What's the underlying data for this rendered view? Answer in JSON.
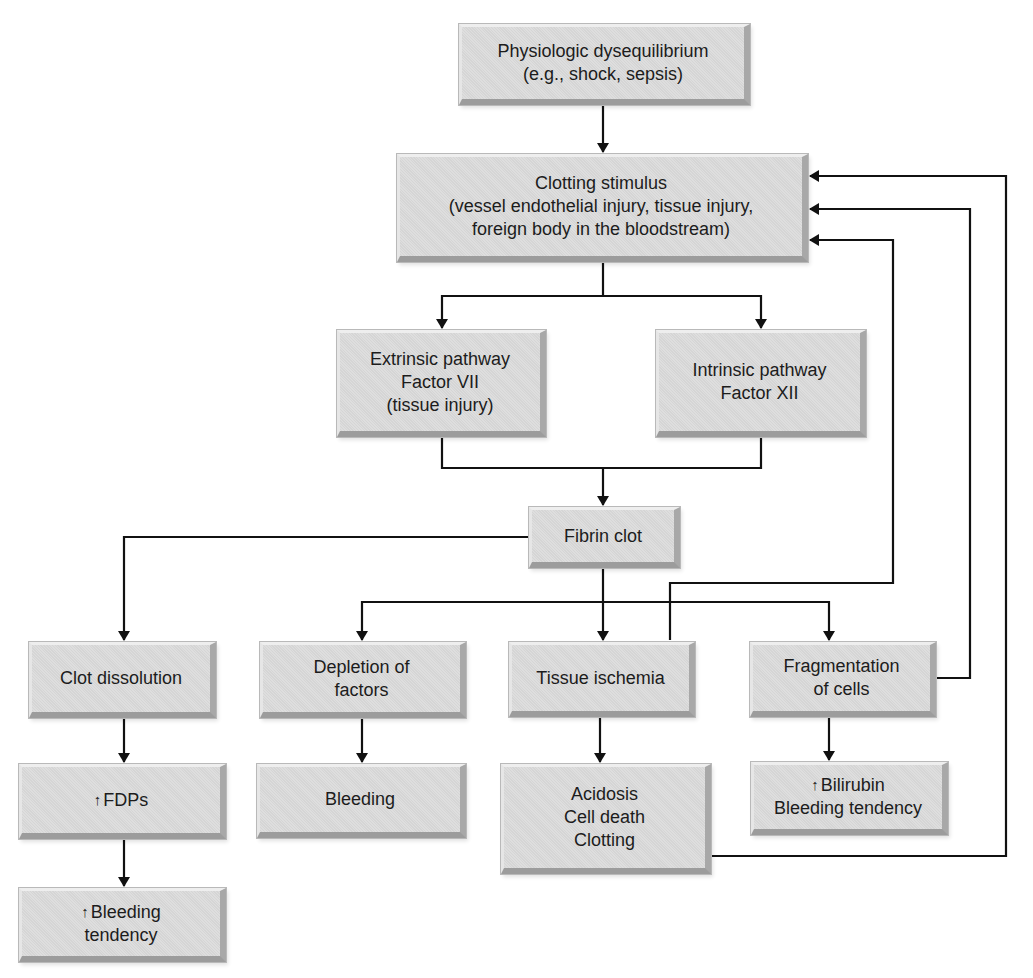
{
  "diagram": {
    "type": "flowchart",
    "nodes": {
      "physiologic": {
        "lines": [
          "Physiologic dysequilibrium",
          "(e.g., shock, sepsis)"
        ]
      },
      "clotting_stimulus": {
        "lines": [
          "Clotting stimulus",
          "(vessel endothelial injury, tissue injury,",
          "foreign body in the bloodstream)"
        ]
      },
      "extrinsic": {
        "lines": [
          "Extrinsic pathway",
          "Factor VII",
          "(tissue injury)"
        ]
      },
      "intrinsic": {
        "lines": [
          "Intrinsic pathway",
          "Factor XII"
        ]
      },
      "fibrin_clot": {
        "lines": [
          "Fibrin clot"
        ]
      },
      "clot_dissolution": {
        "lines": [
          "Clot dissolution"
        ]
      },
      "depletion": {
        "lines": [
          "Depletion of",
          "factors"
        ]
      },
      "tissue_ischemia": {
        "lines": [
          "Tissue ischemia"
        ]
      },
      "fragmentation": {
        "lines": [
          "Fragmentation",
          "of cells"
        ]
      },
      "fdps": {
        "arrow": "↑",
        "lines": [
          "FDPs"
        ]
      },
      "bleeding": {
        "lines": [
          "Bleeding"
        ]
      },
      "acidosis": {
        "lines": [
          "Acidosis",
          "Cell death",
          "Clotting"
        ]
      },
      "bilirubin": {
        "arrow": "↑",
        "lines": [
          "Bilirubin",
          "Bleeding tendency"
        ]
      },
      "bleeding_tendency": {
        "arrow": "↑",
        "lines": [
          "Bleeding",
          "tendency"
        ]
      }
    },
    "edges": [
      {
        "from": "physiologic",
        "to": "clotting_stimulus"
      },
      {
        "from": "clotting_stimulus",
        "to": "extrinsic"
      },
      {
        "from": "clotting_stimulus",
        "to": "intrinsic"
      },
      {
        "from": "extrinsic",
        "to": "fibrin_clot"
      },
      {
        "from": "intrinsic",
        "to": "fibrin_clot"
      },
      {
        "from": "fibrin_clot",
        "to": "clot_dissolution"
      },
      {
        "from": "fibrin_clot",
        "to": "depletion"
      },
      {
        "from": "fibrin_clot",
        "to": "tissue_ischemia"
      },
      {
        "from": "fibrin_clot",
        "to": "fragmentation"
      },
      {
        "from": "clot_dissolution",
        "to": "fdps"
      },
      {
        "from": "fdps",
        "to": "bleeding_tendency"
      },
      {
        "from": "depletion",
        "to": "bleeding"
      },
      {
        "from": "tissue_ischemia",
        "to": "acidosis"
      },
      {
        "from": "fragmentation",
        "to": "bilirubin"
      },
      {
        "from": "tissue_ischemia",
        "to": "clotting_stimulus",
        "feedback": true
      },
      {
        "from": "fragmentation",
        "to": "clotting_stimulus",
        "feedback": true
      },
      {
        "from": "acidosis",
        "to": "clotting_stimulus",
        "feedback": true
      }
    ],
    "colors": {
      "box_fill": "#dcdcdc",
      "line": "#111111",
      "text": "#1c1c1c",
      "background": "#ffffff"
    }
  }
}
